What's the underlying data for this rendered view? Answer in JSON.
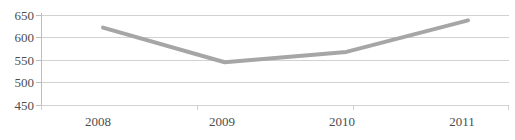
{
  "chart_data": {
    "type": "line",
    "title": "",
    "subtitle": "",
    "xlabel": "",
    "ylabel": "",
    "categories": [
      "2008",
      "2009",
      "2010",
      "2011"
    ],
    "x": [
      2008,
      2009,
      2010,
      2011
    ],
    "values": [
      622,
      545,
      568,
      638
    ],
    "series": [
      {
        "name": "",
        "values": [
          622,
          545,
          568,
          638
        ],
        "color": "#a6a6a6"
      }
    ],
    "ylim": [
      450,
      650
    ],
    "yticks": [
      450,
      500,
      550,
      600,
      650
    ],
    "ytick_labels": [
      "450",
      "500",
      "550",
      "600",
      "650"
    ],
    "xtick_labels": [
      "2008",
      "2009",
      "2010",
      "2011"
    ],
    "grid": true,
    "grid_axis": "y",
    "grid_color": "#d2d2d2",
    "legend": false,
    "legend_position": "none",
    "markers": false,
    "line_width": 4,
    "axis_line_color": "#bdbdbd",
    "tick_label_color": "#4d4d4d",
    "background": "#ffffff",
    "annotations": []
  }
}
